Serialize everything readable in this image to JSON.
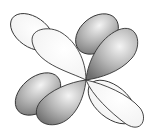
{
  "diagram": {
    "title": "",
    "colors": {
      "light": "#ffffff",
      "shaded": "#8a8a8a",
      "stroke": "#333333"
    },
    "lobes": [
      {
        "id": "back-upper-left",
        "shade": "light"
      },
      {
        "id": "back-upper-right",
        "shade": "shaded"
      },
      {
        "id": "back-lower-left",
        "shade": "shaded"
      },
      {
        "id": "back-lower-right",
        "shade": "light"
      },
      {
        "id": "front-upper-left",
        "shade": "light"
      },
      {
        "id": "front-upper-right",
        "shade": "shaded"
      },
      {
        "id": "front-lower-left",
        "shade": "shaded"
      },
      {
        "id": "front-lower-right",
        "shade": "light"
      }
    ]
  }
}
